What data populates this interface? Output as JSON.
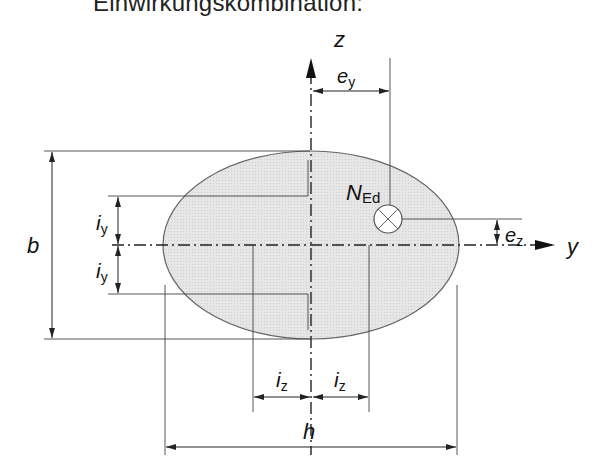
{
  "title": "Einwirkungskombination:",
  "axes": {
    "z_label": "z",
    "y_label": "y"
  },
  "labels": {
    "force_main": "N",
    "force_sub": "Ed",
    "e_y_main": "e",
    "e_y_sub": "y",
    "e_z_main": "e",
    "e_z_sub": "z",
    "b": "b",
    "h": "h",
    "i_y_main": "i",
    "i_y_sub": "y",
    "i_z_main": "i",
    "i_z_sub": "z"
  },
  "colors": {
    "fill": "#e3e3e3",
    "stroke": "#555555",
    "line": "#333333"
  }
}
